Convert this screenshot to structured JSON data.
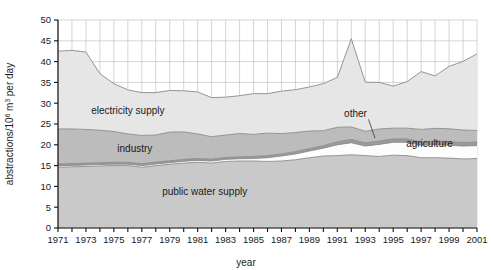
{
  "chart_data": {
    "type": "area",
    "stacked": true,
    "title": "",
    "xlabel": "year",
    "ylabel": "abstractions/10^6 m^3 per day",
    "ylabel_parts": {
      "prefix": "abstractions/10",
      "sup1": "6",
      "mid": " m",
      "sup2": "3",
      "suffix": " per day"
    },
    "xlim": [
      1971,
      2001
    ],
    "ylim": [
      0,
      50
    ],
    "ytick_step": 5,
    "xtick_step": 1,
    "xlabel_step": 2,
    "grid": true,
    "legend_position": "inline-labels",
    "yticks": [
      "0",
      "5",
      "10",
      "15",
      "20",
      "25",
      "30",
      "35",
      "40",
      "45",
      "50"
    ],
    "x": [
      1971,
      1972,
      1973,
      1974,
      1975,
      1976,
      1977,
      1978,
      1979,
      1980,
      1981,
      1982,
      1983,
      1984,
      1985,
      1986,
      1987,
      1988,
      1989,
      1990,
      1991,
      1992,
      1993,
      1994,
      1995,
      1996,
      1997,
      1998,
      1999,
      2000,
      2001
    ],
    "xticklabels": [
      "1971",
      "",
      "1973",
      "",
      "1975",
      "",
      "1977",
      "",
      "1979",
      "",
      "1981",
      "",
      "1983",
      "",
      "1985",
      "",
      "1987",
      "",
      "1989",
      "",
      "1991",
      "",
      "1993",
      "",
      "1995",
      "",
      "1997",
      "",
      "1999",
      "",
      "2001"
    ],
    "series": [
      {
        "name": "public water supply",
        "color": "#c9c9c9",
        "label_x": 1981.5,
        "label_y": 8.0,
        "values": [
          14.6,
          14.7,
          14.8,
          14.9,
          15.0,
          15.0,
          14.6,
          15.0,
          15.3,
          15.6,
          15.8,
          15.6,
          16.0,
          16.1,
          16.1,
          16.0,
          16.1,
          16.4,
          16.9,
          17.3,
          17.4,
          17.6,
          17.4,
          17.2,
          17.5,
          17.4,
          16.9,
          16.9,
          16.8,
          16.6,
          16.7
        ]
      },
      {
        "name": "agriculture",
        "color": "#fdfdfd",
        "label_x": 1997.6,
        "label_y": 19.5,
        "label_anchor": "middle",
        "values": [
          0.35,
          0.35,
          0.35,
          0.35,
          0.35,
          0.35,
          0.4,
          0.4,
          0.4,
          0.45,
          0.45,
          0.5,
          0.5,
          0.55,
          0.6,
          0.9,
          1.2,
          1.4,
          1.6,
          1.9,
          2.6,
          2.9,
          2.3,
          2.9,
          3.1,
          3.2,
          3.0,
          3.2,
          3.1,
          3.1,
          3.1
        ]
      },
      {
        "name": "other",
        "color": "#9a9a9a",
        "label_x": 1992.3,
        "label_y": 26.6,
        "leader_to_x": 1993.7,
        "leader_to_y": 21.6,
        "values": [
          0.45,
          0.45,
          0.45,
          0.45,
          0.45,
          0.45,
          0.45,
          0.45,
          0.45,
          0.45,
          0.45,
          0.45,
          0.45,
          0.45,
          0.5,
          0.5,
          0.5,
          0.55,
          0.6,
          0.6,
          0.7,
          0.8,
          0.75,
          0.8,
          0.8,
          0.8,
          0.8,
          0.85,
          0.85,
          0.85,
          0.85
        ]
      },
      {
        "name": "industry",
        "color": "#bcbcbc",
        "label_x": 1976.5,
        "label_y": 18.2,
        "values": [
          8.4,
          8.3,
          8.1,
          7.8,
          7.4,
          6.8,
          6.8,
          6.5,
          6.9,
          6.6,
          5.9,
          5.4,
          5.4,
          5.6,
          5.3,
          5.4,
          4.9,
          4.6,
          4.2,
          3.6,
          3.5,
          3.0,
          2.8,
          2.9,
          2.6,
          2.6,
          3.0,
          3.0,
          3.1,
          3.0,
          2.8
        ]
      },
      {
        "name": "electricity supply",
        "color": "#e6e6e6",
        "label_x": 1976.0,
        "label_y": 27.5,
        "values": [
          18.7,
          18.9,
          18.6,
          13.6,
          11.5,
          10.6,
          10.3,
          10.2,
          10.0,
          9.9,
          10.1,
          9.4,
          9.1,
          9.1,
          9.8,
          9.5,
          10.2,
          10.3,
          10.6,
          11.3,
          12.0,
          21.2,
          11.8,
          11.2,
          10.1,
          11.2,
          13.9,
          12.6,
          15.0,
          16.5,
          18.4
        ]
      }
    ],
    "total": [
      42.5,
      42.7,
      42.3,
      37.1,
      34.7,
      33.2,
      32.55,
      32.55,
      33.05,
      33.0,
      32.65,
      31.35,
      31.45,
      31.8,
      32.3,
      32.3,
      32.9,
      33.25,
      33.9,
      34.7,
      36.2,
      45.5,
      35.05,
      35.0,
      34.1,
      35.2,
      37.6,
      36.55,
      38.85,
      40.05,
      41.85
    ]
  },
  "icons": {
    "leader_line": "leader-line"
  }
}
